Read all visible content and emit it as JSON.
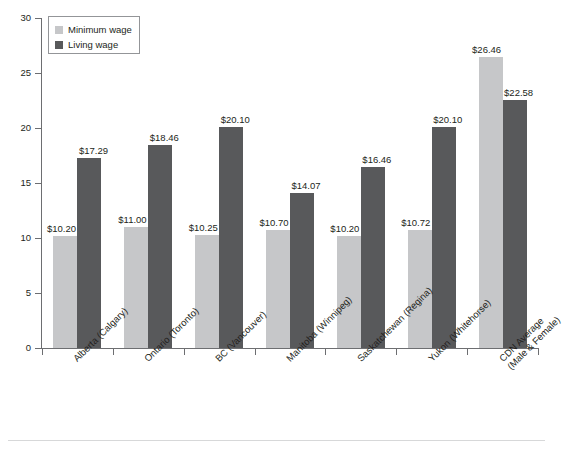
{
  "chart_data": {
    "type": "bar",
    "title": "",
    "subtitle": "",
    "xlabel": "",
    "ylabel": "",
    "ylim": [
      0,
      30
    ],
    "yticks": [
      0,
      5,
      10,
      15,
      20,
      25,
      30
    ],
    "ytick_labels": [
      "0",
      "5",
      "10",
      "15",
      "20",
      "25",
      "30"
    ],
    "grid": false,
    "legend_position": "top-left",
    "categories": [
      "Alberta (Calgary)",
      "Ontario (Toronto)",
      "BC (Vancouver)",
      "Manitoba (Winnipeg)",
      "Saskatchewan (Regina)",
      "Yukon (Whitehorse)",
      "CDN Average (Male & Female)"
    ],
    "category_lines": [
      [
        "Alberta (Calgary)"
      ],
      [
        "Ontario (Toronto)"
      ],
      [
        "BC (Vancouver)"
      ],
      [
        "Manitoba (Winnipeg)"
      ],
      [
        "Saskatchewan (Regina)"
      ],
      [
        "Yukon (Whitehorse)"
      ],
      [
        "CDN Average",
        "(Male & Female)"
      ]
    ],
    "series": [
      {
        "name": "Minimum wage",
        "color": "#c6c7c9",
        "values": [
          10.2,
          11.0,
          10.25,
          10.7,
          10.2,
          10.72,
          26.46
        ],
        "labels": [
          "$10.20",
          "$11.00",
          "$10.25",
          "$10.70",
          "$10.20",
          "$10.72",
          "$26.46"
        ]
      },
      {
        "name": "Living wage",
        "color": "#58595b",
        "values": [
          17.29,
          18.46,
          20.1,
          14.07,
          16.46,
          20.1,
          22.58
        ],
        "labels": [
          "$17.29",
          "$18.46",
          "$20.10",
          "$14.07",
          "$16.46",
          "$20.10",
          "$22.58"
        ]
      }
    ]
  },
  "legend": {
    "items": [
      {
        "label": "Minimum wage",
        "swatch": "min"
      },
      {
        "label": "Living wage",
        "swatch": "living"
      }
    ]
  },
  "colors": {
    "minimum_wage": "#c6c7c9",
    "living_wage": "#58595b",
    "axis": "#6d6e71",
    "text": "#231f20",
    "background": "#ffffff",
    "footer_rule": "#d7d8d9"
  }
}
